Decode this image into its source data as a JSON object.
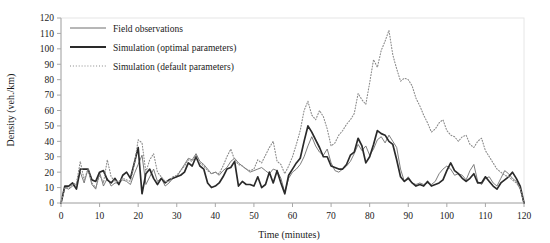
{
  "chart_data": {
    "type": "line",
    "title": "",
    "xlabel": "Time (minutes)",
    "ylabel": "Density (veh./km)",
    "xlim": [
      0,
      120
    ],
    "ylim": [
      0,
      120
    ],
    "xticks": [
      0,
      10,
      20,
      30,
      40,
      50,
      60,
      70,
      80,
      90,
      100,
      110,
      120
    ],
    "yticks": [
      0,
      10,
      20,
      30,
      40,
      50,
      60,
      70,
      80,
      90,
      100,
      110,
      120
    ],
    "grid": false,
    "legend_position": "top-left",
    "x": [
      0,
      1,
      2,
      3,
      4,
      5,
      6,
      7,
      8,
      9,
      10,
      11,
      12,
      13,
      14,
      15,
      16,
      17,
      18,
      19,
      20,
      21,
      22,
      23,
      24,
      25,
      26,
      27,
      28,
      29,
      30,
      31,
      32,
      33,
      34,
      35,
      36,
      37,
      38,
      39,
      40,
      41,
      42,
      43,
      44,
      45,
      46,
      47,
      48,
      49,
      50,
      51,
      52,
      53,
      54,
      55,
      56,
      57,
      58,
      59,
      60,
      61,
      62,
      63,
      64,
      65,
      66,
      67,
      68,
      69,
      70,
      71,
      72,
      73,
      74,
      75,
      76,
      77,
      78,
      79,
      80,
      81,
      82,
      83,
      84,
      85,
      86,
      87,
      88,
      89,
      90,
      91,
      92,
      93,
      94,
      95,
      96,
      97,
      98,
      99,
      100,
      101,
      102,
      103,
      104,
      105,
      106,
      107,
      108,
      109,
      110,
      111,
      112,
      113,
      114,
      115,
      116,
      117,
      118,
      119,
      120
    ],
    "series": [
      {
        "name": "Field observations",
        "style": "thin-solid",
        "color": "#6e6e6e",
        "values": [
          0,
          10,
          9,
          11,
          12,
          20,
          13,
          22,
          12,
          9,
          20,
          11,
          16,
          11,
          13,
          13,
          15,
          14,
          12,
          19,
          25,
          31,
          12,
          17,
          22,
          14,
          16,
          11,
          13,
          16,
          17,
          21,
          25,
          29,
          28,
          32,
          27,
          25,
          22,
          19,
          20,
          18,
          21,
          23,
          27,
          29,
          26,
          24,
          22,
          20,
          21,
          22,
          23,
          21,
          19,
          22,
          21,
          16,
          7,
          16,
          20,
          22,
          25,
          30,
          37,
          43,
          37,
          33,
          31,
          35,
          26,
          21,
          20,
          22,
          24,
          27,
          32,
          38,
          34,
          37,
          31,
          35,
          41,
          43,
          39,
          44,
          40,
          36,
          22,
          14,
          17,
          13,
          12,
          13,
          12,
          13,
          12,
          14,
          19,
          22,
          24,
          22,
          18,
          19,
          18,
          15,
          21,
          25,
          14,
          12,
          16,
          17,
          13,
          11,
          16,
          21,
          19,
          16,
          14,
          9,
          0
        ]
      },
      {
        "name": "Simulation (optimal parameters)",
        "style": "thick-solid",
        "color": "#2a2a2a",
        "values": [
          0,
          11,
          11,
          13,
          9,
          22,
          22,
          22,
          15,
          14,
          20,
          21,
          15,
          13,
          16,
          12,
          18,
          20,
          16,
          26,
          36,
          6,
          19,
          22,
          16,
          12,
          16,
          13,
          15,
          16,
          17,
          18,
          20,
          26,
          24,
          30,
          24,
          22,
          13,
          10,
          11,
          13,
          17,
          22,
          23,
          27,
          11,
          14,
          12,
          12,
          11,
          17,
          10,
          12,
          20,
          13,
          21,
          13,
          6,
          18,
          22,
          26,
          29,
          40,
          50,
          46,
          41,
          36,
          30,
          30,
          24,
          23,
          22,
          22,
          25,
          31,
          33,
          42,
          37,
          26,
          30,
          38,
          47,
          45,
          44,
          40,
          38,
          28,
          17,
          14,
          16,
          13,
          11,
          12,
          11,
          14,
          11,
          12,
          13,
          15,
          21,
          26,
          21,
          19,
          16,
          14,
          16,
          19,
          13,
          13,
          17,
          14,
          11,
          9,
          13,
          15,
          17,
          20,
          16,
          11,
          0
        ]
      },
      {
        "name": "Simulation (default parameters)",
        "style": "dotted",
        "color": "#8a8a8a",
        "values": [
          0,
          10,
          10,
          12,
          13,
          27,
          15,
          22,
          13,
          10,
          18,
          13,
          28,
          17,
          14,
          14,
          16,
          15,
          14,
          25,
          41,
          39,
          20,
          28,
          32,
          20,
          17,
          14,
          14,
          17,
          18,
          21,
          24,
          28,
          27,
          31,
          26,
          24,
          21,
          19,
          20,
          19,
          24,
          30,
          35,
          28,
          25,
          24,
          22,
          21,
          22,
          28,
          26,
          31,
          36,
          40,
          27,
          25,
          19,
          24,
          30,
          38,
          47,
          60,
          66,
          57,
          54,
          60,
          56,
          48,
          37,
          39,
          44,
          47,
          51,
          54,
          58,
          71,
          67,
          64,
          78,
          93,
          88,
          99,
          105,
          112,
          96,
          87,
          79,
          81,
          80,
          76,
          68,
          63,
          57,
          52,
          46,
          48,
          52,
          54,
          47,
          44,
          43,
          40,
          43,
          44,
          38,
          36,
          40,
          42,
          34,
          30,
          26,
          22,
          20,
          18,
          17,
          15,
          13,
          10,
          0
        ]
      }
    ]
  },
  "legend": {
    "items": [
      {
        "label": "Field observations"
      },
      {
        "label": "Simulation (optimal parameters)"
      },
      {
        "label": "Simulation (default parameters)"
      }
    ]
  },
  "axes": {
    "x_label": "Time (minutes)",
    "y_label": "Density (veh./km)"
  },
  "colors": {
    "field": "#6e6e6e",
    "optimal": "#2a2a2a",
    "default": "#8a8a8a",
    "axis": "#a8a8a8",
    "frame": "#e6e6e6"
  }
}
